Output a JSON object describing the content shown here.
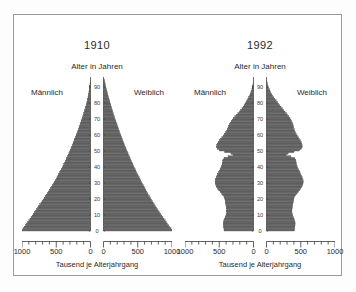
{
  "figure": {
    "background_color": "#ffffff",
    "frame_color": "#9a9a9a",
    "bar_color": "#6d6d6d",
    "bar_edge_color": "#3f3f3f"
  },
  "panels": [
    {
      "title": "1910",
      "axis_title": "Alter in Jahren",
      "male_label": "Männlich",
      "female_label": "Weiblich",
      "xaxis_caption": "Tausend je Alterjahrgang"
    },
    {
      "title": "1992",
      "axis_title": "Alter in Jahren",
      "male_label": "Männlich",
      "female_label": "Weiblich",
      "xaxis_caption": "Tausend je Alterjahrgang"
    }
  ],
  "chart_data": [
    {
      "type": "bar",
      "title": "1910",
      "subtitle": "Alter in Jahren",
      "orientation": "horizontal",
      "layout": "population-pyramid",
      "xlabel": "Tausend je Alterjahrgang",
      "ylabel": "Alter in Jahren",
      "xlim": [
        0,
        1000
      ],
      "ylim": [
        0,
        95
      ],
      "grid": false,
      "legend": "none",
      "x_ticks": [
        1000,
        500,
        0,
        0,
        500,
        1000
      ],
      "x_minor_tick_step": 100,
      "y_ticks": [
        0,
        10,
        20,
        30,
        40,
        50,
        60,
        70,
        80,
        90
      ],
      "ages": [
        0,
        1,
        2,
        3,
        4,
        5,
        6,
        7,
        8,
        9,
        10,
        11,
        12,
        13,
        14,
        15,
        16,
        17,
        18,
        19,
        20,
        21,
        22,
        23,
        24,
        25,
        26,
        27,
        28,
        29,
        30,
        31,
        32,
        33,
        34,
        35,
        36,
        37,
        38,
        39,
        40,
        41,
        42,
        43,
        44,
        45,
        46,
        47,
        48,
        49,
        50,
        51,
        52,
        53,
        54,
        55,
        56,
        57,
        58,
        59,
        60,
        61,
        62,
        63,
        64,
        65,
        66,
        67,
        68,
        69,
        70,
        71,
        72,
        73,
        74,
        75,
        76,
        77,
        78,
        79,
        80,
        81,
        82,
        83,
        84,
        85,
        86,
        87,
        88,
        89,
        90,
        91,
        92,
        93,
        94
      ],
      "series": [
        {
          "name": "Männlich",
          "side": "left",
          "values": [
            1000,
            985,
            968,
            950,
            932,
            915,
            900,
            884,
            868,
            852,
            836,
            820,
            804,
            788,
            772,
            756,
            740,
            724,
            708,
            692,
            676,
            660,
            645,
            630,
            615,
            600,
            586,
            572,
            558,
            544,
            530,
            516,
            502,
            489,
            476,
            463,
            450,
            438,
            426,
            414,
            402,
            390,
            379,
            368,
            357,
            346,
            335,
            325,
            315,
            305,
            295,
            285,
            275,
            265,
            256,
            247,
            238,
            229,
            220,
            211,
            202,
            193,
            184,
            176,
            168,
            160,
            152,
            144,
            136,
            128,
            120,
            112,
            105,
            98,
            91,
            84,
            77,
            70,
            64,
            58,
            52,
            46,
            41,
            36,
            31,
            27,
            23,
            19,
            16,
            13,
            10,
            8,
            6,
            4,
            2
          ]
        },
        {
          "name": "Weiblich",
          "side": "right",
          "values": [
            1000,
            985,
            968,
            950,
            932,
            915,
            900,
            884,
            868,
            852,
            836,
            820,
            804,
            788,
            772,
            756,
            742,
            728,
            714,
            700,
            686,
            672,
            658,
            645,
            632,
            619,
            606,
            593,
            580,
            568,
            556,
            544,
            532,
            520,
            508,
            496,
            484,
            473,
            462,
            451,
            440,
            429,
            418,
            408,
            398,
            388,
            378,
            368,
            358,
            348,
            338,
            328,
            318,
            309,
            300,
            291,
            282,
            273,
            264,
            255,
            246,
            237,
            229,
            221,
            213,
            205,
            197,
            189,
            181,
            173,
            165,
            157,
            149,
            142,
            135,
            128,
            121,
            114,
            107,
            100,
            93,
            86,
            79,
            72,
            66,
            60,
            54,
            48,
            42,
            36,
            31,
            26,
            21,
            16,
            11
          ]
        }
      ]
    },
    {
      "type": "bar",
      "title": "1992",
      "subtitle": "Alter in Jahren",
      "orientation": "horizontal",
      "layout": "population-pyramid",
      "xlabel": "Tausend je Alterjahrgang",
      "ylabel": "Alter in Jahren",
      "xlim": [
        0,
        1000
      ],
      "ylim": [
        0,
        95
      ],
      "grid": false,
      "legend": "none",
      "x_ticks": [
        1000,
        500,
        0,
        0,
        500,
        1000
      ],
      "x_minor_tick_step": 100,
      "y_ticks": [
        0,
        10,
        20,
        30,
        40,
        50,
        60,
        70,
        80,
        90
      ],
      "ages": [
        0,
        1,
        2,
        3,
        4,
        5,
        6,
        7,
        8,
        9,
        10,
        11,
        12,
        13,
        14,
        15,
        16,
        17,
        18,
        19,
        20,
        21,
        22,
        23,
        24,
        25,
        26,
        27,
        28,
        29,
        30,
        31,
        32,
        33,
        34,
        35,
        36,
        37,
        38,
        39,
        40,
        41,
        42,
        43,
        44,
        45,
        46,
        47,
        48,
        49,
        50,
        51,
        52,
        53,
        54,
        55,
        56,
        57,
        58,
        59,
        60,
        61,
        62,
        63,
        64,
        65,
        66,
        67,
        68,
        69,
        70,
        71,
        72,
        73,
        74,
        75,
        76,
        77,
        78,
        79,
        80,
        81,
        82,
        83,
        84,
        85,
        86,
        87,
        88,
        89,
        90,
        91,
        92,
        93,
        94
      ],
      "series": [
        {
          "name": "Männlich",
          "side": "left",
          "values": [
            430,
            432,
            435,
            438,
            440,
            438,
            432,
            424,
            414,
            404,
            396,
            392,
            390,
            392,
            396,
            400,
            404,
            408,
            412,
            416,
            420,
            432,
            448,
            466,
            486,
            506,
            524,
            538,
            548,
            556,
            560,
            558,
            552,
            544,
            534,
            524,
            512,
            500,
            488,
            476,
            466,
            458,
            452,
            448,
            446,
            430,
            372,
            300,
            330,
            420,
            500,
            530,
            540,
            536,
            528,
            516,
            500,
            482,
            462,
            442,
            424,
            408,
            394,
            382,
            372,
            362,
            352,
            340,
            326,
            310,
            292,
            272,
            250,
            228,
            206,
            186,
            168,
            152,
            138,
            124,
            110,
            96,
            82,
            70,
            58,
            48,
            38,
            30,
            23,
            17,
            12,
            8,
            5,
            3,
            2
          ]
        },
        {
          "name": "Weiblich",
          "side": "right",
          "values": [
            408,
            410,
            413,
            416,
            418,
            416,
            410,
            402,
            393,
            383,
            376,
            372,
            370,
            372,
            376,
            380,
            384,
            388,
            392,
            396,
            400,
            412,
            428,
            446,
            464,
            482,
            500,
            514,
            524,
            532,
            536,
            534,
            528,
            520,
            510,
            500,
            489,
            478,
            466,
            455,
            446,
            439,
            434,
            430,
            428,
            412,
            356,
            287,
            316,
            402,
            480,
            510,
            522,
            520,
            514,
            506,
            494,
            480,
            464,
            448,
            434,
            422,
            412,
            404,
            398,
            392,
            386,
            378,
            368,
            356,
            342,
            326,
            308,
            290,
            270,
            250,
            230,
            212,
            194,
            176,
            158,
            140,
            122,
            106,
            90,
            76,
            62,
            50,
            40,
            30,
            22,
            15,
            10,
            6,
            3
          ]
        }
      ]
    }
  ]
}
